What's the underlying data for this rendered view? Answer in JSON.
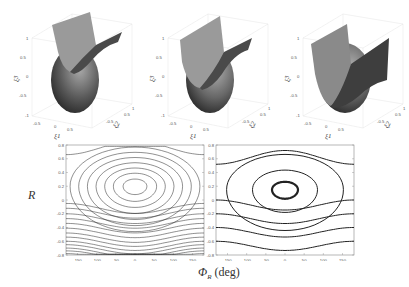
{
  "figure": {
    "y_axis_label": "R",
    "x_axis_label_symbol": "Φ",
    "x_axis_label_subscript": "R",
    "x_axis_label_unit": "(deg)"
  },
  "chart_data": [
    {
      "type": "surface3d",
      "panel": "top-left",
      "xlabel": "ξ1",
      "ylabel": "ξ2",
      "zlabel": "ξ3",
      "zticks": [
        "-1",
        "-0.5",
        "0",
        "0.5",
        "1"
      ],
      "xticks": [
        "-0.5",
        "0",
        "0.5"
      ],
      "yticks": [
        "-1",
        "-0.5",
        "0",
        "0.5",
        "1"
      ],
      "description": "Unit sphere intersected by a curved saddle-shaped surface"
    },
    {
      "type": "surface3d",
      "panel": "top-middle",
      "xlabel": "ξ1",
      "ylabel": "ξ2",
      "zlabel": "ξ3",
      "zticks": [
        "-1",
        "-0.5",
        "0",
        "0.5",
        "1"
      ],
      "xticks": [
        "-0.5",
        "0",
        "0.5"
      ],
      "yticks": [
        "-1",
        "-0.5",
        "0",
        "0.5",
        "1"
      ],
      "description": "Unit sphere intersected by a curved surface (intermediate case)"
    },
    {
      "type": "surface3d",
      "panel": "top-right",
      "xlabel": "ξ1",
      "ylabel": "ξ2",
      "zlabel": "ξ3",
      "zticks": [
        "-1",
        "-0.5",
        "0",
        "0.5",
        "1"
      ],
      "xticks": [
        "-0.5",
        "0",
        "0.5"
      ],
      "yticks": [
        "-1",
        "-0.5",
        "0",
        "0.5",
        "1"
      ],
      "description": "Unit sphere intersected by a curved surface, deeper intersection"
    },
    {
      "type": "contour",
      "panel": "bottom-left",
      "xlim": [
        -180,
        180
      ],
      "ylim": [
        -0.8,
        0.8
      ],
      "xticks": [
        "-150",
        "-100",
        "-50",
        "0",
        "50",
        "100",
        "150"
      ],
      "yticks": [
        "0.8",
        "0.6",
        "0.4",
        "0.2",
        "0",
        "-0.2",
        "-0.4",
        "-0.6",
        "-0.8"
      ],
      "center": [
        0,
        0.2
      ],
      "closed_levels": [
        0.11,
        0.2,
        0.28,
        0.36,
        0.44,
        0.52,
        0.6
      ],
      "open_levels_below": [
        -0.05,
        -0.12,
        -0.2,
        -0.27,
        -0.34,
        -0.41,
        -0.48,
        -0.54,
        -0.6,
        -0.65,
        -0.7,
        -0.74,
        -0.78
      ],
      "open_levels_above": [
        0.66
      ]
    },
    {
      "type": "contour",
      "panel": "bottom-right",
      "xlim": [
        -180,
        180
      ],
      "ylim": [
        -0.8,
        0.8
      ],
      "xticks": [
        "-150",
        "-100",
        "-50",
        "0",
        "50",
        "100",
        "150"
      ],
      "yticks": [
        "0.8",
        "0.6",
        "0.4",
        "0.2",
        "0",
        "-0.2",
        "-0.4",
        "-0.6",
        "-0.8"
      ],
      "center": [
        0,
        0.15
      ],
      "closed_levels": [
        0.12,
        0.3,
        0.54
      ],
      "open_levels_below": [
        0.0,
        -0.2,
        -0.4,
        -0.6
      ],
      "open_levels_above": [
        0.52
      ]
    }
  ]
}
